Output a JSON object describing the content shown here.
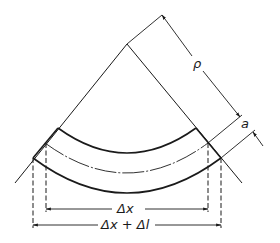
{
  "diagram": {
    "type": "curved beam bending geometry",
    "labels": {
      "rho": "ρ",
      "a": "a",
      "delta_x": "Δx",
      "delta_x_plus_delta_l": "Δx + Δl"
    },
    "elements": [
      "left radial boundary line",
      "right radial boundary line",
      "inner (top) arc",
      "neutral (middle) dashed arc",
      "outer (bottom) arc",
      "radius of curvature dimension ρ",
      "offset dimension a",
      "chord dimension Δx",
      "chord dimension Δx + Δl"
    ],
    "colors": {
      "line": "#1a1a1a",
      "background": "#ffffff"
    }
  }
}
